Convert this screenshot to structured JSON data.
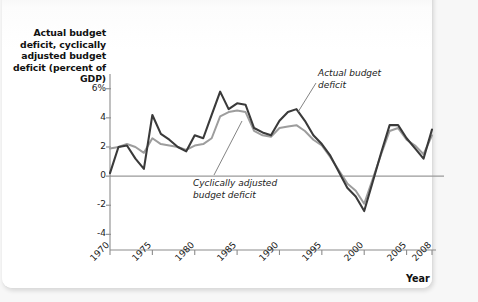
{
  "figure": {
    "y_axis_title": "Actual budget deficit, cyclically adjusted budget deficit (percent of GDP)",
    "x_axis_title": "Year",
    "annotations": {
      "actual": "Actual budget\ndeficit",
      "cyclical": "Cyclically adjusted\nbudget deficit"
    }
  },
  "colors": {
    "actual_line": "#3a3a3a",
    "cyclical_line": "#9d9d9d",
    "axis": "#8c8c8c",
    "zero_line": "#9a9a9a",
    "text": "#111111",
    "card": "#ffffff",
    "page_background": "#f7f7f7"
  },
  "axes": {
    "y_ticks": [
      "6%",
      "4",
      "2",
      "0",
      "-2",
      "-4"
    ],
    "y_values": [
      6,
      4,
      2,
      0,
      -2,
      -4
    ],
    "x_ticks": [
      "1970",
      "1975",
      "1980",
      "1985",
      "1990",
      "1995",
      "2000",
      "2005",
      "2008"
    ],
    "x_values": [
      1970,
      1975,
      1980,
      1985,
      1990,
      1995,
      2000,
      2005,
      2008
    ],
    "ylim": [
      -4.8,
      6.6
    ],
    "xlim": [
      1970,
      2008
    ],
    "grid": false
  },
  "chart_data": {
    "type": "line",
    "title": "Actual budget deficit, cyclically adjusted budget deficit (percent of GDP)",
    "xlabel": "Year",
    "ylabel": "Actual budget deficit, cyclically adjusted budget deficit (percent of GDP)",
    "xlim": [
      1970,
      2008
    ],
    "ylim": [
      -4.8,
      6.6
    ],
    "grid": false,
    "legend": "annotated-inline",
    "x": [
      1970,
      1971,
      1972,
      1973,
      1974,
      1975,
      1976,
      1977,
      1978,
      1979,
      1980,
      1981,
      1982,
      1983,
      1984,
      1985,
      1986,
      1987,
      1988,
      1989,
      1990,
      1991,
      1992,
      1993,
      1994,
      1995,
      1996,
      1997,
      1998,
      1999,
      2000,
      2001,
      2002,
      2003,
      2004,
      2005,
      2006,
      2007,
      2008
    ],
    "series": [
      {
        "name": "Actual budget deficit",
        "color": "#3a3a3a",
        "values": [
          0.2,
          2.0,
          2.1,
          1.2,
          0.5,
          4.2,
          2.9,
          2.5,
          2.0,
          1.7,
          2.8,
          2.6,
          4.2,
          5.8,
          4.6,
          5.0,
          4.9,
          3.3,
          3.0,
          2.8,
          3.8,
          4.4,
          4.6,
          3.8,
          2.8,
          2.2,
          1.4,
          0.3,
          -0.8,
          -1.4,
          -2.4,
          -0.4,
          1.6,
          3.5,
          3.5,
          2.6,
          1.9,
          1.2,
          3.2
        ]
      },
      {
        "name": "Cyclically adjusted budget deficit",
        "color": "#9d9d9d",
        "values": [
          1.9,
          2.0,
          2.2,
          2.0,
          1.6,
          2.6,
          2.2,
          2.1,
          2.0,
          1.8,
          2.1,
          2.2,
          2.6,
          4.1,
          4.4,
          4.5,
          4.4,
          3.1,
          2.8,
          2.7,
          3.3,
          3.4,
          3.5,
          3.1,
          2.5,
          2.1,
          1.3,
          0.4,
          -0.5,
          -1.0,
          -1.9,
          -0.2,
          1.5,
          3.1,
          3.3,
          2.5,
          2.1,
          1.5,
          2.8
        ]
      }
    ]
  }
}
